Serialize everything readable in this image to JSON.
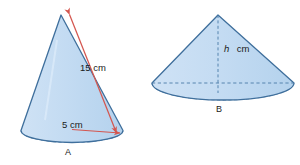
{
  "figure": {
    "background_color": "#ffffff",
    "cone_fill_color": "#bdd7f0",
    "cone_fill_color_light": "#cfe2f5",
    "cone_stroke_color": "#4a7ba7",
    "dashed_stroke_color": "#4a7ba7",
    "annotation_color": "#d4564f",
    "text_color": "#1a1a1a"
  },
  "cones": [
    {
      "id": "cone-a",
      "label": "A",
      "orientation": "tall-upright",
      "annotations": [
        {
          "id": "slant-height",
          "name": "slant-height-label",
          "text": "15 cm",
          "value": 15,
          "unit": "cm",
          "symbol": "",
          "style": "double-arrow",
          "color": "#d4564f"
        },
        {
          "id": "base-radius",
          "name": "base-radius-label",
          "text": "5 cm",
          "value": 5,
          "unit": "cm",
          "symbol": "",
          "style": "single-arrow",
          "color": "#d4564f"
        }
      ]
    },
    {
      "id": "cone-b",
      "label": "B",
      "orientation": "wide-flat",
      "annotations": [
        {
          "id": "height",
          "name": "height-label",
          "text": "cm",
          "value": null,
          "unit": "cm",
          "symbol": "h",
          "style": "dashed-line",
          "color": "#1a1a1a"
        }
      ]
    }
  ]
}
